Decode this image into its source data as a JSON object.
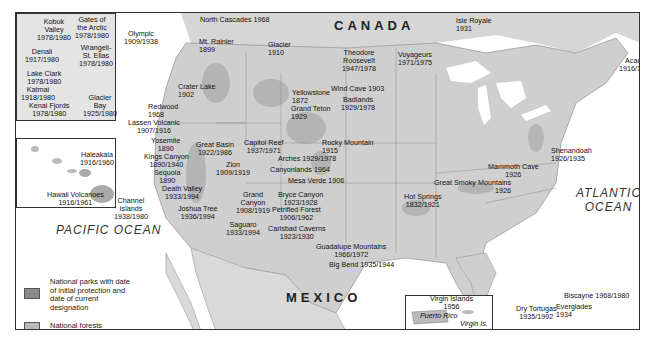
{
  "map": {
    "countries": {
      "canada": "CANADA",
      "mexico": "MEXICO"
    },
    "oceans": {
      "pacific": "PACIFIC OCEAN",
      "atlantic_line1": "ATLANTIC",
      "atlantic_line2": "OCEAN"
    },
    "insets": {
      "puerto_rico": "Puerto Rico",
      "virgin_is": "Virgin Is."
    },
    "legend": {
      "parks_label": "National parks with date of initial protection and date of current designation",
      "forests_label": "National forests",
      "parks_color": "#8a8a8a",
      "forests_color": "#b8b8b8"
    },
    "parks": {
      "kobuk_valley": [
        "Kobuk",
        "Valley",
        "1978/1980"
      ],
      "gates_arctic": [
        "Gates of",
        "the Arctic",
        "1978/1980"
      ],
      "denali": [
        "Denali",
        "1917/1980"
      ],
      "wrangell": [
        "Wrangell-",
        "St. Elias",
        "1978/1980"
      ],
      "lake_clark": [
        "Lake Clark",
        "1978/1980"
      ],
      "katmai": [
        "Katmai",
        "1918/1980"
      ],
      "kenai_fjords": [
        "Kenai Fjords",
        "1978/1980"
      ],
      "glacier_bay": [
        "Glacier",
        "Bay",
        "1925/1980"
      ],
      "haleakala": [
        "Haleakala",
        "1916/1960"
      ],
      "hawaii_volcanoes": [
        "Hawaii Volcanoes",
        "1916/1961"
      ],
      "olympic": [
        "Olympic",
        "1909/1938"
      ],
      "north_cascades": [
        "North Cascades 1968"
      ],
      "mt_rainier": [
        "Mt. Rainier",
        "1899"
      ],
      "glacier": [
        "Glacier",
        "1910"
      ],
      "crater_lake": [
        "Crater Lake",
        "1902"
      ],
      "yellowstone": [
        "Yellowstone",
        "1872"
      ],
      "grand_teton": [
        "Grand Teton",
        "1929"
      ],
      "redwood": [
        "Redwood",
        "1968"
      ],
      "lassen": [
        "Lassen Volcanic",
        "1907/1916"
      ],
      "yosemite": [
        "Yosemite",
        "1890"
      ],
      "kings_canyon": [
        "Kings Canyon",
        "1890/1940"
      ],
      "sequoia": [
        "Sequoia",
        "1890"
      ],
      "death_valley": [
        "Death Valley",
        "1933/1994"
      ],
      "channel_islands": [
        "Channel",
        "Islands",
        "1938/1980"
      ],
      "joshua_tree": [
        "Joshua Tree",
        "1936/1994"
      ],
      "great_basin": [
        "Great Basin",
        "1922/1986"
      ],
      "capitol_reef": [
        "Capitol Reef",
        "1937/1971"
      ],
      "zion": [
        "Zion",
        "1909/1919"
      ],
      "grand_canyon": [
        "Grand",
        "Canyon",
        "1908/1919"
      ],
      "saguaro": [
        "Saguaro",
        "1933/1994"
      ],
      "theodore_roosevelt": [
        "Theodore",
        "Roosevelt",
        "1947/1978"
      ],
      "wind_cave": [
        "Wind Cave 1903"
      ],
      "badlands": [
        "Badlands",
        "1929/1978"
      ],
      "rocky_mountain": [
        "Rocky Mountain",
        "1915"
      ],
      "arches": [
        "Arches 1929/1978"
      ],
      "canyonlands": [
        "Canyonlands 1964"
      ],
      "mesa_verde": [
        "Mesa Verde 1906"
      ],
      "bryce_canyon": [
        "Bryce Canyon",
        "1923/1928"
      ],
      "petrified_forest": [
        "Petrified Forest",
        "1906/1962"
      ],
      "carlsbad": [
        "Carlsbad Caverns",
        "1923/1930"
      ],
      "guadalupe": [
        "Guadalupe Mountains",
        "1966/1972"
      ],
      "big_bend": [
        "Big Bend 1935/1944"
      ],
      "voyageurs": [
        "Voyageurs",
        "1971/1975"
      ],
      "isle_royale": [
        "Isle Royale",
        "1931"
      ],
      "acadia": [
        "Acadia",
        "1916/1929"
      ],
      "shenandoah": [
        "Shenandoah",
        "1926/1935"
      ],
      "mammoth_cave": [
        "Mammoth Cave",
        "1926"
      ],
      "great_smoky": [
        "Great Smoky Mountains",
        "1926"
      ],
      "hot_springs": [
        "Hot Springs",
        "1832/1921"
      ],
      "virgin_islands": [
        "Virgin Islands",
        "1956"
      ],
      "biscayne": [
        "Biscayne 1968/1980"
      ],
      "everglades": [
        "Everglades",
        "1934"
      ],
      "dry_tortugas": [
        "Dry Tortugas",
        "1935/1992"
      ]
    }
  }
}
